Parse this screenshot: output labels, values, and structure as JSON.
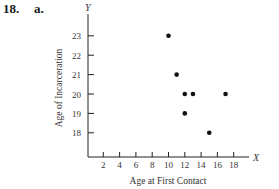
{
  "header": {
    "problem_number": "18.",
    "part_label": "a."
  },
  "chart_data": {
    "type": "scatter",
    "title": "",
    "xlabel": "Age at First Contact",
    "ylabel": "Age of Incarceration",
    "x_axis_letter": "X",
    "y_axis_letter": "Y",
    "x_ticks": [
      2,
      4,
      6,
      8,
      10,
      12,
      14,
      16,
      18
    ],
    "y_ticks": [
      18,
      19,
      20,
      21,
      22,
      23
    ],
    "xlim": [
      0,
      20
    ],
    "ylim": [
      17.5,
      24
    ],
    "grid": false,
    "legend": null,
    "points": [
      {
        "x": 10,
        "y": 23
      },
      {
        "x": 11,
        "y": 21
      },
      {
        "x": 12,
        "y": 20
      },
      {
        "x": 13,
        "y": 20
      },
      {
        "x": 17,
        "y": 20
      },
      {
        "x": 12,
        "y": 19
      },
      {
        "x": 15,
        "y": 18
      }
    ],
    "marker_color": "#111111"
  }
}
